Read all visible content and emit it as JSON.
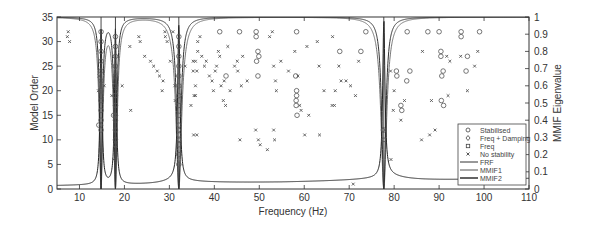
{
  "chart_data": {
    "type": "scatter",
    "title": "",
    "xlabel": "Frequency (Hz)",
    "ylabel": "Model Order",
    "y2label": "MMIF Eigenvalue",
    "xlim": [
      5,
      110
    ],
    "ylim": [
      0,
      35
    ],
    "y2lim": [
      0,
      1
    ],
    "xticks": [
      10,
      20,
      30,
      40,
      50,
      60,
      70,
      80,
      90,
      100,
      110
    ],
    "yticks": [
      0,
      5,
      10,
      15,
      20,
      25,
      30,
      35
    ],
    "y2ticks": [
      0,
      0.1,
      0.2,
      0.3,
      0.4,
      0.5,
      0.6,
      0.7,
      0.8,
      0.9,
      1
    ],
    "grid": false,
    "legend_position": "lower right",
    "legend": [
      "Stabilised",
      "Freq + Damping",
      "Freq",
      "No stability",
      "FRF",
      "MMIF1",
      "MMIF2"
    ],
    "resonances_hz": [
      14.8,
      18.0,
      32.1,
      77.7
    ],
    "series": [
      {
        "name": "Stabilised",
        "marker": "circle",
        "points": [
          [
            14.8,
            12
          ],
          [
            14.8,
            14
          ],
          [
            14.8,
            16
          ],
          [
            14.8,
            18
          ],
          [
            14.8,
            20
          ],
          [
            14.8,
            22
          ],
          [
            14.8,
            24
          ],
          [
            14.8,
            26
          ],
          [
            14.8,
            28
          ],
          [
            14.8,
            30
          ],
          [
            14.8,
            32
          ],
          [
            14.3,
            13
          ],
          [
            18.0,
            10
          ],
          [
            18.0,
            12
          ],
          [
            18.0,
            14
          ],
          [
            18.0,
            15
          ],
          [
            18.0,
            17
          ],
          [
            18.0,
            19
          ],
          [
            18.0,
            21
          ],
          [
            18.0,
            23
          ],
          [
            18.0,
            25
          ],
          [
            18.0,
            27
          ],
          [
            18.0,
            29
          ],
          [
            18.0,
            31
          ],
          [
            17.6,
            15
          ],
          [
            32.1,
            5
          ],
          [
            32.1,
            7
          ],
          [
            32.1,
            9
          ],
          [
            32.1,
            11
          ],
          [
            32.1,
            13
          ],
          [
            32.1,
            15
          ],
          [
            32.1,
            17
          ],
          [
            32.1,
            19
          ],
          [
            32.1,
            21
          ],
          [
            32.1,
            23
          ],
          [
            32.1,
            25
          ],
          [
            32.1,
            27
          ],
          [
            32.1,
            29
          ],
          [
            32.1,
            31
          ],
          [
            41.2,
            32
          ],
          [
            45.6,
            32
          ],
          [
            49.3,
            32
          ],
          [
            49.3,
            31
          ],
          [
            49.7,
            28
          ],
          [
            49.9,
            27
          ],
          [
            49.4,
            26
          ],
          [
            42.6,
            23
          ],
          [
            49.7,
            23
          ],
          [
            58.3,
            32
          ],
          [
            58.1,
            23
          ],
          [
            58.3,
            20
          ],
          [
            58.3,
            19
          ],
          [
            58.2,
            18
          ],
          [
            58.2,
            17
          ],
          [
            58.4,
            15
          ],
          [
            73.7,
            32
          ],
          [
            67.9,
            28
          ],
          [
            72.6,
            28
          ],
          [
            77.7,
            12
          ],
          [
            80.5,
            24
          ],
          [
            80.6,
            23
          ],
          [
            82.8,
            22
          ],
          [
            83.5,
            24
          ],
          [
            81.5,
            17
          ],
          [
            81.7,
            16
          ],
          [
            82.9,
            32
          ],
          [
            87.5,
            32
          ],
          [
            90.0,
            32
          ],
          [
            90.4,
            28
          ],
          [
            90.4,
            27
          ],
          [
            90.6,
            23
          ],
          [
            90.9,
            24
          ],
          [
            90.5,
            18
          ],
          [
            91.0,
            17
          ],
          [
            94.9,
            32
          ],
          [
            94.9,
            31
          ],
          [
            96.0,
            24
          ],
          [
            96.3,
            27
          ],
          [
            99.0,
            32
          ]
        ]
      },
      {
        "name": "Freq + Damping",
        "marker": "diamond",
        "points": [
          [
            14.8,
            13
          ],
          [
            18.0,
            15
          ],
          [
            32.1,
            12
          ],
          [
            77.5,
            12
          ]
        ]
      },
      {
        "name": "Freq",
        "marker": "square",
        "points": [
          [
            14.8,
            8
          ],
          [
            18.0,
            9
          ],
          [
            32.1,
            10
          ],
          [
            77.7,
            10
          ]
        ]
      },
      {
        "name": "No stability",
        "marker": "x",
        "points": [
          [
            7.5,
            32
          ],
          [
            7.3,
            31
          ],
          [
            7.8,
            30
          ],
          [
            14.2,
            20
          ],
          [
            14.3,
            23
          ],
          [
            15.5,
            21
          ],
          [
            17.2,
            19
          ],
          [
            17.6,
            6
          ],
          [
            19.5,
            21
          ],
          [
            21.4,
            16
          ],
          [
            21.2,
            29
          ],
          [
            23.2,
            31
          ],
          [
            23.5,
            30
          ],
          [
            24.5,
            27
          ],
          [
            25.8,
            26
          ],
          [
            26.5,
            25
          ],
          [
            27.3,
            24
          ],
          [
            27.8,
            23
          ],
          [
            28.6,
            22
          ],
          [
            28.4,
            20
          ],
          [
            29.0,
            32
          ],
          [
            29.1,
            31
          ],
          [
            29.5,
            30
          ],
          [
            30.2,
            26
          ],
          [
            30.8,
            32
          ],
          [
            31.2,
            21
          ],
          [
            31.3,
            18
          ],
          [
            33.5,
            25
          ],
          [
            34.8,
            17
          ],
          [
            35.3,
            26
          ],
          [
            35.3,
            24
          ],
          [
            35.4,
            11
          ],
          [
            35.8,
            19
          ],
          [
            36.3,
            30
          ],
          [
            36.3,
            28
          ],
          [
            36.8,
            31
          ],
          [
            37.2,
            27
          ],
          [
            35.8,
            26
          ],
          [
            36.1,
            24
          ],
          [
            35.8,
            21
          ],
          [
            35.5,
            19
          ],
          [
            36.1,
            11
          ],
          [
            37.8,
            25
          ],
          [
            38.2,
            26
          ],
          [
            38.9,
            23
          ],
          [
            39.5,
            22
          ],
          [
            39.8,
            20
          ],
          [
            40.2,
            24
          ],
          [
            40.5,
            25
          ],
          [
            40.9,
            28
          ],
          [
            41.2,
            27
          ],
          [
            41.5,
            21
          ],
          [
            42.0,
            18
          ],
          [
            42.5,
            17
          ],
          [
            42.2,
            22
          ],
          [
            43.0,
            29
          ],
          [
            43.5,
            20
          ],
          [
            44.5,
            25
          ],
          [
            45.1,
            26
          ],
          [
            45.2,
            24
          ],
          [
            46.0,
            21
          ],
          [
            46.3,
            27
          ],
          [
            47.3,
            22
          ],
          [
            45.7,
            10
          ],
          [
            49.2,
            12
          ],
          [
            49.8,
            10
          ],
          [
            50.2,
            9
          ],
          [
            51.8,
            8
          ],
          [
            52.3,
            31
          ],
          [
            52.9,
            32
          ],
          [
            53.2,
            25
          ],
          [
            53.6,
            22
          ],
          [
            53.8,
            20
          ],
          [
            53.2,
            12
          ],
          [
            53.4,
            10
          ],
          [
            54.8,
            26
          ],
          [
            56.5,
            24
          ],
          [
            57.9,
            28
          ],
          [
            58.6,
            23
          ],
          [
            59.0,
            17
          ],
          [
            59.3,
            16
          ],
          [
            60.1,
            11
          ],
          [
            60.6,
            29
          ],
          [
            61.0,
            15
          ],
          [
            62.9,
            30
          ],
          [
            63.3,
            25
          ],
          [
            63.4,
            11
          ],
          [
            64.4,
            20
          ],
          [
            66.2,
            17
          ],
          [
            66.7,
            17
          ],
          [
            66.3,
            31
          ],
          [
            66.9,
            20
          ],
          [
            67.7,
            25
          ],
          [
            68.2,
            22
          ],
          [
            69.3,
            22
          ],
          [
            70.3,
            21
          ],
          [
            70.9,
            1
          ],
          [
            71.4,
            19
          ],
          [
            72.1,
            26
          ],
          [
            79.2,
            24
          ],
          [
            80.0,
            20
          ],
          [
            79.8,
            16
          ],
          [
            79.3,
            6
          ],
          [
            81.5,
            14
          ],
          [
            82.3,
            18
          ],
          [
            86.3,
            28
          ],
          [
            86.1,
            10
          ],
          [
            87.9,
            11
          ],
          [
            88.3,
            18
          ],
          [
            89.1,
            12
          ],
          [
            91.7,
            27
          ],
          [
            92.4,
            26
          ],
          [
            92.0,
            19
          ],
          [
            94.8,
            27
          ],
          [
            96.3,
            20
          ],
          [
            97.9,
            25
          ],
          [
            98.6,
            28
          ]
        ]
      }
    ],
    "lines": [
      {
        "name": "FRF",
        "axis": "right",
        "description": "peaks to 1.0 at resonances, baseline ~0.03-0.06"
      },
      {
        "name": "MMIF1",
        "axis": "right",
        "description": "dips to 0 at resonances, ~1.0 elsewhere"
      },
      {
        "name": "MMIF2",
        "axis": "right",
        "description": "secondary indicator near 1.0"
      }
    ]
  }
}
